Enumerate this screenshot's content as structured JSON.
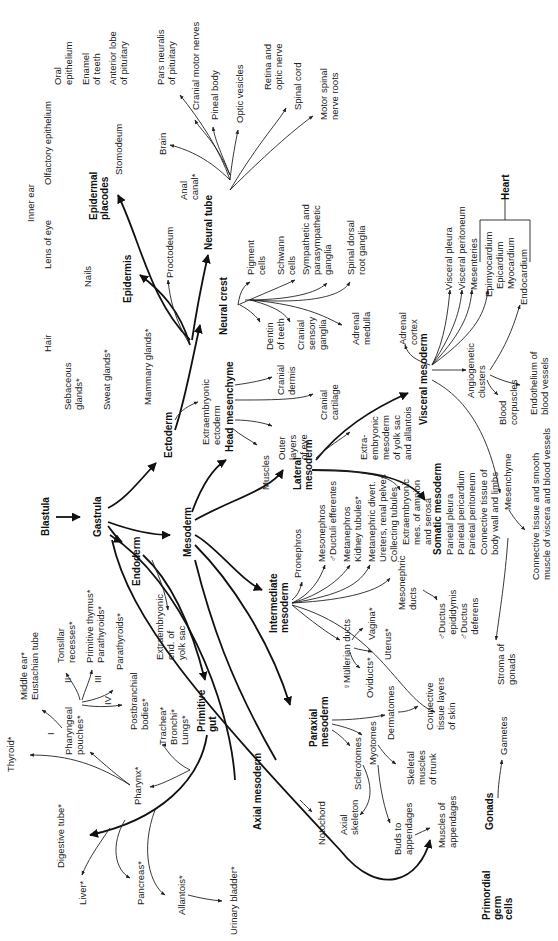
{
  "diagram": {
    "orientation": "rotated -90deg",
    "nodes": {
      "blastula": "Blastula",
      "gastrula": "Gastrula",
      "ectoderm": "Ectoderm",
      "mesoderm": "Mesoderm",
      "endoderm": "Endoderm",
      "epidermis": "Epidermis",
      "epidermal_placodes": "Epidermal\nplacodes",
      "neural_tube": "Neural tube",
      "neural_crest": "Neural crest",
      "head_mesenchyme": "Head mesenchyme",
      "lateral_mesoderm": "Lateral\nmesoderm",
      "visceral_mesoderm": "Visceral mesoderm",
      "somatic_mesoderm": "Somatic mesoderm",
      "intermediate_mesoderm": "Intermediate\nmesoderm",
      "paraxial_mesoderm": "Paraxial\nmesoderm",
      "axial_mesoderm": "Axial mesoderm",
      "primitive_gut": "Primitive\ngut",
      "gonads": "Gonads",
      "primordial_germ_cells": "Primordial\ngerm\ncells",
      "heart": "Heart"
    },
    "labels": {
      "oral_epithelium": "Oral\nepithelium",
      "enamel_of_teeth": "Enamel\nof teeth",
      "anterior_lobe_pituitary": "Anterior lobe\nof pituitary",
      "olfactory_epithelium": "Olfactory epithelium",
      "stomodeum": "Stomodeum",
      "inner_ear": "Inner ear",
      "lens_of_eye": "Lens of eye",
      "pars_neuralis": "Pars neuralis\nof pituitary",
      "cranial_motor_nerves": "Cranial motor nerves",
      "pineal_body": "Pineal body",
      "optic_vesicles": "Optic vesicles",
      "retina_optic_nerve": "Retina and\noptic nerve",
      "spinal_cord": "Spinal cord",
      "motor_spinal_nerve_roots": "Motor spinal\nnerve roots",
      "brain": "Brain",
      "anal_canal": "Anal\ncanal*",
      "proctodeum": "Proctodeum",
      "nails": "Nails",
      "hair": "Hair",
      "sebaceous_glands": "Sebaceous\nglands*",
      "sweat_glands": "Sweat glands*",
      "mammary_glands": "Mammary glands*",
      "extraembryonic_ectoderm": "Extraembryonic\nectoderm",
      "pigment_cells": "Pigment\ncells",
      "schwann_cells": "Schwann\ncells",
      "sympathetic_ganglia": "Sympathetic and\nparasympathetic\nganglia",
      "spinal_dorsal_root_ganglia": "Spinal dorsal\nroot ganglia",
      "dentin_of_teeth": "Dentin\nof teeth",
      "cranial_sensory_ganglia": "Cranial\nsensory\nganglia",
      "adrenal_medulla": "Adrenal\nmedulla",
      "cranial_dermis": "Cranial\ndermis",
      "cranial_cartilage": "Cranial\ncartilage",
      "outer_layers_of_eye": "Outer\nlayers\nof eye",
      "muscles": "Muscles",
      "adrenal_cortex": "Adrenal\ncortex",
      "visceral_pleura": "Visceral pleura",
      "visceral_peritoneum": "Visceral peritoneum",
      "mesenteries": "Mesenteries",
      "epimyocardium": "Epimyocardium\n   Epicardium\n   Myocardium",
      "endocardium": "Endocardium",
      "angiogenetic_clusters": "Angiogenetic\nclusters",
      "blood_corpuscles": "Blood\ncorpuscles",
      "endothelium_blood_vessels": "Endothelium of\nblood vessels",
      "extraembryonic_mesoderm_yolk": "Extra-\nembryonic\nmesoderm\nof yolk sac\nand allantois",
      "extraembryonic_mes_amnion": "Extraembryonic\nmes. of amnion\nand serosa",
      "parietal_layers": "Parietal pleura\nParietal pericardium\nParietal peritoneum",
      "connective_body_wall": "Connective tissue of\nbody wall and limbs",
      "mesenchyme": "Mesenchyme",
      "connective_smooth_muscle": "Connective tissue and smooth\nmuscle of viscera and blood vessels",
      "pronephros": "Pronephros",
      "mesonephros": "Mesonephros\n♂Ductuli efferentes",
      "metanephros": "Metanephros\nKidney tubules*",
      "metanephric_divert": "Metanephric divert.\nUreters, renal pelves\nCollecting tubules",
      "mesonephric_ducts": "Mesonephric\nducts",
      "ductus_epididymis": "♂Ductus\n  epididymis\n♂Ductus\n  deferens",
      "mullerian_ducts": "♀Müllerian ducts",
      "vagina": "Vagina*",
      "uterus": "Uterus*",
      "oviducts": "Oviducts*",
      "stroma_of_gonads": "Stroma of\ngonads",
      "dermatomes": "Dermatomes",
      "connective_skin": "Connective\ntissue layers\nof skin",
      "sclerotomes": "Sclerotomes",
      "myotomes": "Myotomes",
      "skeletal_muscles_trunk": "Skeletal\nmuscles\nof trunk",
      "axial_skeleton": "Axial\nskeleton",
      "notochord": "Notochord",
      "buds_to_appendages": "Buds to\nappendages",
      "muscles_of_appendages": "Muscles of\nappendages",
      "gametes": "Gametes",
      "extraembryonic_yolk_sac": "Extraembryonic\nend. of\nyolk sac",
      "middle_ear": "Middle ear*\nEustachian tube",
      "tonsillar_recesses": "Tonsillar\nrecesses*",
      "primitive_thymus": "Primitive thymus*\nParathyroids*",
      "parathyroids": "Parathyroids*",
      "postbranchial_bodies": "Postbranchial\nbodies*",
      "pouch_I": "I",
      "pouch_II": "II",
      "pouch_III": "III",
      "pouch_IV": "IV",
      "pharyngeal_pouches": "Pharyngeal\npouches*",
      "trachea": "Trachea*\nBronchi*\nLungs*",
      "thyroid": "Thyroid*",
      "pharynx": "Pharynx*",
      "digestive_tube": "Digestive tube*",
      "liver": "Liver*",
      "pancreas": "Pancreas*",
      "allantois": "Allantois*",
      "urinary_bladder": "Urinary bladder*"
    }
  }
}
